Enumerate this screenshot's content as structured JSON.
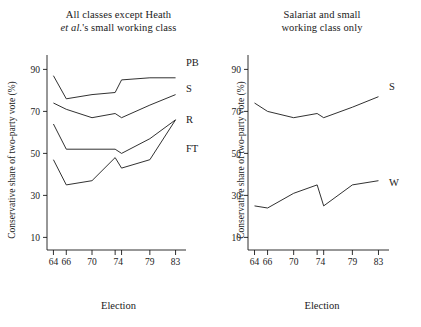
{
  "figure": {
    "ylabel": "Conservative share of two-party vote (%)",
    "xlabel": "Election"
  },
  "panels": {
    "left": {
      "title_line1": "All classes except Heath",
      "title_line2_italic": "et al.",
      "title_line2_rest": "'s small working class"
    },
    "right": {
      "title_line1": "Salariat and small",
      "title_line2": "working class only"
    }
  },
  "axis": {
    "yticks": [
      "10",
      "30",
      "50",
      "70",
      "90"
    ],
    "ytick_values": [
      10,
      30,
      50,
      70,
      90
    ],
    "ylim": [
      4,
      94
    ],
    "xticks": [
      "64",
      "66",
      "70",
      "74",
      "79",
      "83"
    ],
    "xtick_values": [
      64,
      66,
      70,
      74,
      79,
      83
    ]
  },
  "chart_data": [
    {
      "type": "line",
      "title": "All classes except Heath et al.'s small working class",
      "xlabel": "Election",
      "ylabel": "Conservative share of two-party vote (%)",
      "x": [
        64,
        66,
        70,
        73.6,
        74.6,
        79,
        83
      ],
      "xtick_labels": [
        "64",
        "66",
        "70",
        "74",
        "74",
        "79",
        "83"
      ],
      "ylim": [
        4,
        94
      ],
      "xlim": [
        63,
        84
      ],
      "grid": false,
      "legend": "inline-right-labels",
      "series": [
        {
          "name": "PB",
          "label": "PB",
          "values": [
            87,
            76,
            78,
            79,
            85,
            86,
            86
          ]
        },
        {
          "name": "S",
          "label": "S",
          "values": [
            74,
            71,
            67,
            69,
            67,
            73,
            78
          ]
        },
        {
          "name": "R",
          "label": "R",
          "values": [
            64,
            52,
            52,
            52,
            50,
            57,
            66
          ]
        },
        {
          "name": "FT",
          "label": "FT",
          "values": [
            47,
            35,
            37,
            48,
            43,
            47,
            66
          ]
        }
      ]
    },
    {
      "type": "line",
      "title": "Salariat and small working class only",
      "xlabel": "Election",
      "ylabel": "Conservative share of two-party vote (%)",
      "x": [
        64,
        66,
        70,
        73.6,
        74.6,
        79,
        83
      ],
      "xtick_labels": [
        "64",
        "66",
        "70",
        "74",
        "74",
        "79",
        "83"
      ],
      "ylim": [
        4,
        94
      ],
      "xlim": [
        63,
        84
      ],
      "grid": false,
      "legend": "inline-right-labels",
      "series": [
        {
          "name": "S",
          "label": "S",
          "values": [
            74,
            70,
            67,
            69,
            67,
            72,
            77
          ]
        },
        {
          "name": "W",
          "label": "W",
          "values": [
            25,
            24,
            31,
            35,
            25,
            35,
            37
          ]
        }
      ]
    }
  ]
}
